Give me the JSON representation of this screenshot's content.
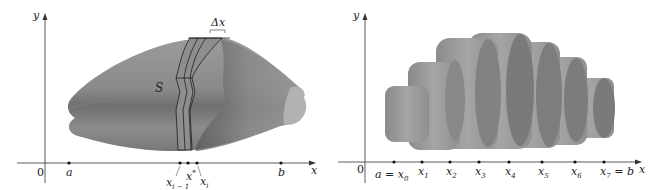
{
  "left_panel": {
    "axis_y_label": "y",
    "axis_x_label": "x",
    "origin_label": "0",
    "solid_label": "S",
    "delta_label": "Δx",
    "points": [
      {
        "name": "a",
        "label": "a"
      },
      {
        "name": "x_i-1",
        "label": "x",
        "sub": "i − 1"
      },
      {
        "name": "x_i*",
        "label": "x",
        "sub": "i",
        "sup": "*"
      },
      {
        "name": "x_i",
        "label": "x",
        "sub": "i"
      },
      {
        "name": "b",
        "label": "b"
      }
    ]
  },
  "right_panel": {
    "axis_y_label": "y",
    "axis_x_label": "x",
    "origin_label": "0",
    "points": [
      {
        "label": "a = x",
        "sub": "0"
      },
      {
        "label": "x",
        "sub": "1"
      },
      {
        "label": "x",
        "sub": "2"
      },
      {
        "label": "x",
        "sub": "3"
      },
      {
        "label": "x",
        "sub": "4"
      },
      {
        "label": "x",
        "sub": "5"
      },
      {
        "label": "x",
        "sub": "6"
      },
      {
        "label": "x",
        "sub": "7",
        "suffix": " = b"
      }
    ]
  },
  "colors": {
    "solid_fill": "#8a8a8a",
    "solid_dark": "#5e5e5e",
    "solid_light": "#a8a8a8",
    "slab_fill": "#9a9a9a",
    "axis": "#333333"
  }
}
